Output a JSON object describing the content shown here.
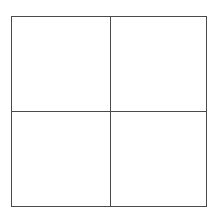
{
  "diagram": {
    "type": "quadrant-grid",
    "rows": 2,
    "columns": 2,
    "line_color": "#4a4a4a",
    "background_color": "#ffffff",
    "quadrants": [
      {
        "position": "top-left",
        "label": ""
      },
      {
        "position": "top-right",
        "label": ""
      },
      {
        "position": "bottom-left",
        "label": ""
      },
      {
        "position": "bottom-right",
        "label": ""
      }
    ]
  }
}
